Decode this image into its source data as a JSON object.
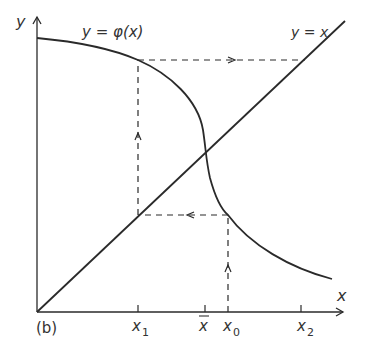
{
  "figure": {
    "panel_label": "(b)",
    "axes": {
      "x_label": "x",
      "y_label": "y"
    },
    "curves": {
      "phi_label": "y = φ(x)",
      "identity_label": "y = x"
    },
    "ticks": [
      {
        "name": "x1",
        "base": "x",
        "sub": "1"
      },
      {
        "name": "xbar",
        "base": "x",
        "bar": true
      },
      {
        "name": "x0",
        "base": "x",
        "sub": "0"
      },
      {
        "name": "x2",
        "base": "x",
        "sub": "2"
      }
    ],
    "tick_labels": {
      "x1": "x",
      "x1_sub": "1",
      "xbar": "x",
      "x0": "x",
      "x0_sub": "0",
      "x2": "x",
      "x2_sub": "2"
    },
    "colors": {
      "line": "#2a2a2a",
      "text": "#333333",
      "background": "#ffffff"
    }
  }
}
